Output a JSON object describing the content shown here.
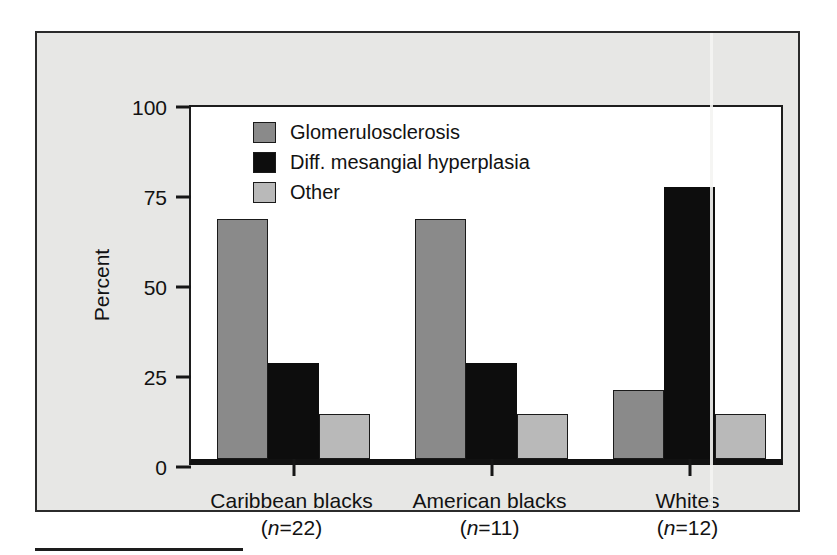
{
  "figure": {
    "background_color": "#e7e7e5",
    "plot_background_color": "#ffffff",
    "frame_color": "#2b2b2b"
  },
  "chart_data": {
    "type": "bar",
    "title": "",
    "xlabel": "",
    "ylabel": "Percent",
    "ylim": [
      0,
      100
    ],
    "yticks": [
      0,
      25,
      50,
      75,
      100
    ],
    "ytick_labels": [
      "0",
      "25",
      "50",
      "75",
      "100"
    ],
    "grid": false,
    "legend_position": "upper-left-inside",
    "categories": [
      "Caribbean blacks",
      "American blacks",
      "Whites"
    ],
    "category_sublabels": [
      "(n=22)",
      "(n=11)",
      "(n=12)"
    ],
    "category_n_values": [
      22,
      11,
      12
    ],
    "series": [
      {
        "name": "Glomerulosclerosis",
        "color": "#8a8a8a",
        "values": [
          66.7,
          66.7,
          19.2
        ]
      },
      {
        "name": "Diff. mesangial hyperplasia",
        "color": "#0d0d0d",
        "values": [
          26.7,
          26.7,
          75.6
        ]
      },
      {
        "name": "Other",
        "color": "#b9b9b9",
        "values": [
          12.5,
          12.5,
          12.5
        ]
      }
    ]
  },
  "legend": {
    "items": [
      {
        "label": "Glomerulosclerosis",
        "color": "#8a8a8a"
      },
      {
        "label": "Diff. mesangial hyperplasia",
        "color": "#0d0d0d"
      },
      {
        "label": "Other",
        "color": "#b9b9b9"
      }
    ]
  }
}
